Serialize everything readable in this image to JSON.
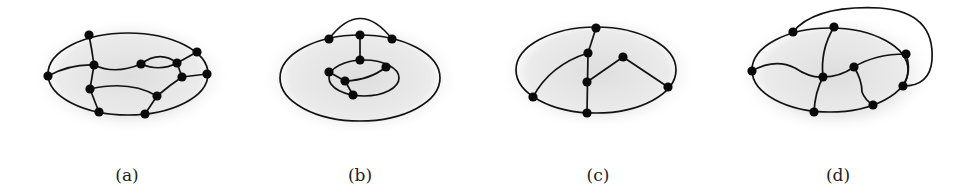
{
  "figure": {
    "panels": [
      {
        "id": "a",
        "label": "(a)",
        "label_pos": [
          127,
          181
        ],
        "shadow": {
          "cx": 130,
          "cy": 76,
          "rx": 100,
          "ry": 58
        },
        "outer": {
          "cx": 128,
          "cy": 74,
          "rx": 80,
          "ry": 41
        },
        "nodes": [
          [
            89,
            35
          ],
          [
            197,
            52
          ],
          [
            48,
            76
          ],
          [
            94,
            65
          ],
          [
            141,
            64
          ],
          [
            177,
            63
          ],
          [
            207,
            74
          ],
          [
            182,
            77
          ],
          [
            90,
            89
          ],
          [
            157,
            96
          ],
          [
            99,
            112
          ],
          [
            145,
            114
          ]
        ],
        "paths": [
          "M89,35 Q92,50 94,65",
          "M48,76 Q70,64 94,65",
          "M94,65 Q115,75 141,64",
          "M141,64 Q160,50 177,63",
          "M141,64 Q160,72 177,63",
          "M177,63 L197,52",
          "M177,63 L182,77",
          "M182,77 L207,74",
          "M94,65 L90,89",
          "M90,89 Q95,102 99,112",
          "M90,89 Q130,80 157,96",
          "M157,96 Q170,85 182,77",
          "M157,96 L145,114"
        ]
      },
      {
        "id": "b",
        "label": "(b)",
        "label_pos": [
          360,
          181
        ],
        "shadow": {
          "cx": 360,
          "cy": 78,
          "rx": 100,
          "ry": 58
        },
        "outer": {
          "cx": 360,
          "cy": 78,
          "rx": 80,
          "ry": 43
        },
        "inner": {
          "cx": 364,
          "cy": 78,
          "rx": 35,
          "ry": 18
        },
        "nodes": [
          [
            329,
            39
          ],
          [
            360,
            35
          ],
          [
            392,
            39
          ],
          [
            360,
            60
          ],
          [
            386,
            67
          ],
          [
            329,
            72
          ],
          [
            345,
            81
          ],
          [
            353,
            95
          ]
        ],
        "paths": [
          "M329,39 Q360,-2 392,39",
          "M360,35 L360,60",
          "M329,72 L345,81",
          "M345,81 L353,95",
          "M345,81 Q370,80 386,67"
        ]
      },
      {
        "id": "c",
        "label": "(c)",
        "label_pos": [
          598,
          181
        ],
        "shadow": {
          "cx": 598,
          "cy": 72,
          "rx": 100,
          "ry": 58
        },
        "outer": {
          "cx": 596,
          "cy": 70,
          "rx": 80,
          "ry": 43
        },
        "nodes": [
          [
            596,
            28
          ],
          [
            588,
            53
          ],
          [
            623,
            57
          ],
          [
            587,
            82
          ],
          [
            533,
            97
          ],
          [
            668,
            87
          ],
          [
            587,
            113
          ]
        ],
        "paths": [
          "M596,28 L588,53",
          "M588,53 L587,113",
          "M533,97 Q550,65 588,53",
          "M587,82 L623,57",
          "M623,57 L668,87"
        ]
      },
      {
        "id": "d",
        "label": "(d)",
        "label_pos": [
          838,
          181
        ],
        "shadow": {
          "cx": 835,
          "cy": 74,
          "rx": 100,
          "ry": 60
        },
        "outer": {
          "cx": 830,
          "cy": 70,
          "rx": 78,
          "ry": 42
        },
        "nodes": [
          [
            793,
            32
          ],
          [
            834,
            27
          ],
          [
            906,
            54
          ],
          [
            752,
            71
          ],
          [
            854,
            67
          ],
          [
            823,
            77
          ],
          [
            903,
            86
          ],
          [
            873,
            105
          ],
          [
            814,
            112
          ]
        ],
        "paths": [
          "M793,32 Q815,5 880,8 Q935,12 932,60 Q930,86 903,86",
          "M834,27 Q820,50 823,77",
          "M752,71 Q775,58 795,68 Q810,78 823,77",
          "M823,77 Q840,77 854,67",
          "M854,67 Q875,54 906,54",
          "M854,67 Q862,80 862,92 Q865,100 873,105",
          "M823,77 Q815,92 814,112",
          "M906,54 Q912,72 903,86"
        ]
      }
    ]
  }
}
